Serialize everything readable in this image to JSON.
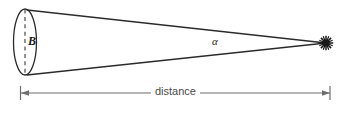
{
  "diagram": {
    "type": "angular-size-geometry",
    "background_color": "#ffffff",
    "line_color": "#2b2b2b",
    "dimension_color": "#6e6e6e",
    "labels": {
      "baseline": "B",
      "angle": "α",
      "distance": "distance"
    },
    "icons": {
      "star": "star-burst-icon",
      "left_arrow": "left-arrowhead-icon",
      "right_arrow": "right-arrowhead-icon"
    },
    "geometry": {
      "ellipse_center_x": 25,
      "ellipse_center_y": 42,
      "ellipse_rx": 11,
      "ellipse_ry": 33,
      "apex_x": 326,
      "apex_y": 43,
      "top_edge_start": [
        27,
        10
      ],
      "bottom_edge_start": [
        27,
        75
      ],
      "dashed_axis_x": 25,
      "dashed_axis_top_y": 10,
      "dashed_axis_bottom_y": 74,
      "dimension_line_y": 93,
      "dimension_left_x": 20,
      "dimension_right_x": 330,
      "tick_top_y": 86,
      "tick_bottom_y": 100
    }
  }
}
